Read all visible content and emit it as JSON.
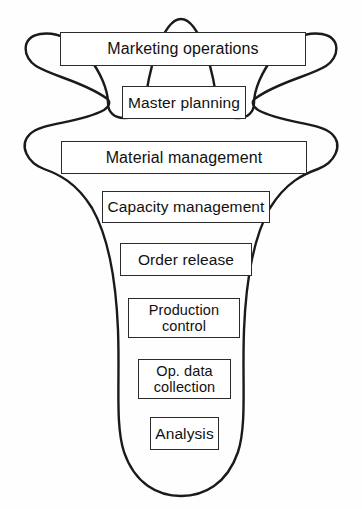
{
  "diagram": {
    "shape_name": "funnel-outline",
    "colors": {
      "background": "#fefefe",
      "outline": "#1a1a1a",
      "box_border": "#2b2b2b",
      "box_fill": "#ffffff",
      "text": "#111111"
    },
    "stages": [
      {
        "id": "marketing-operations",
        "label": "Marketing operations"
      },
      {
        "id": "master-planning",
        "label": "Master planning"
      },
      {
        "id": "material-management",
        "label": "Material management"
      },
      {
        "id": "capacity-management",
        "label": "Capacity management"
      },
      {
        "id": "order-release",
        "label": "Order release"
      },
      {
        "id": "production-control",
        "label": "Production\ncontrol"
      },
      {
        "id": "op-data-collection",
        "label": "Op. data\ncollection"
      },
      {
        "id": "analysis",
        "label": "Analysis"
      }
    ]
  }
}
